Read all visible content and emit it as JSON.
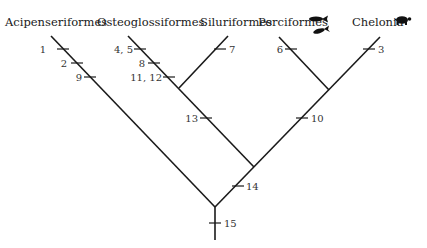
{
  "taxa": [
    {
      "name": "Acipenseriformes"
    },
    {
      "name": "Osteoglossiformes"
    },
    {
      "name": "Siluriformes"
    },
    {
      "name": "Perciformes",
      "icon": "fish-icon"
    },
    {
      "name": "Chelonia",
      "icon": "turtle-icon"
    }
  ],
  "characters": {
    "acip_1": "1",
    "acip_2": "2",
    "acip_9": "9",
    "osteo_45": "4, 5",
    "osteo_8": "8",
    "osteo_1112": "11, 12",
    "silur_7": "7",
    "perci_6": "6",
    "chel_3": "3",
    "node_13": "13",
    "node_10": "10",
    "node_14": "14",
    "root_15": "15"
  },
  "colors": {
    "line": "#1a1a1a",
    "text": "#1a1a1a",
    "background": "#ffffff"
  }
}
